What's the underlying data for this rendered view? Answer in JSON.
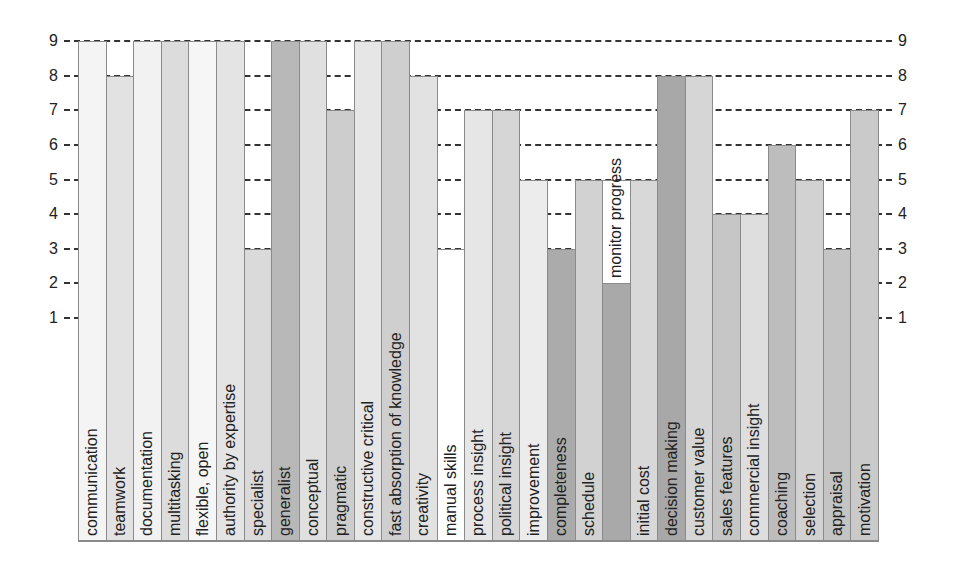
{
  "chart_data": {
    "type": "bar",
    "title": "",
    "xlabel": "",
    "ylabel": "",
    "ylim": [
      0,
      9
    ],
    "yticks": [
      1,
      2,
      3,
      4,
      5,
      6,
      7,
      8,
      9
    ],
    "y_axis_both_sides": true,
    "grid": "horizontal dashed",
    "legend": "none",
    "labels_inside_bars_rotated": true,
    "categories": [
      "communication",
      "teamwork",
      "documentation",
      "multitasking",
      "flexible, open",
      "authority by expertise",
      "specialist",
      "generalist",
      "conceptual",
      "pragmatic",
      "constructive critical",
      "fast absorption of knowledge",
      "creativity",
      "manual skills",
      "process insight",
      "political insight",
      "improvement",
      "completeness",
      "schedule",
      "monitor progress",
      "initial cost",
      "decision making",
      "customer value",
      "sales features",
      "commercial insight",
      "coaching",
      "selection",
      "appraisal",
      "motivation"
    ],
    "values": [
      9,
      8,
      9,
      9,
      9,
      9,
      3,
      9,
      9,
      7,
      9,
      9,
      8,
      3,
      7,
      7,
      5,
      3,
      5,
      2,
      5,
      8,
      8,
      4,
      4,
      6,
      5,
      3,
      7
    ],
    "colors": [
      "#f4f4f4",
      "#e2e2e2",
      "#f2f2f2",
      "#dcdcdc",
      "#f6f6f6",
      "#e4e4e4",
      "#dadada",
      "#b8b8b8",
      "#e0e0e0",
      "#cdcdcd",
      "#e6e6e6",
      "#cfcfcf",
      "#e2e2e2",
      "#ffffff",
      "#e6e6e6",
      "#d6d6d6",
      "#ececec",
      "#ababab",
      "#d2d2d2",
      "#a9a9a9",
      "#d8d8d8",
      "#a8a8a8",
      "#d6d6d6",
      "#c6c6c6",
      "#dedede",
      "#bdbdbd",
      "#d2d2d2",
      "#c4c4c4",
      "#cacaca"
    ]
  },
  "axis": {
    "left_ticks": [
      "1",
      "2",
      "3",
      "4",
      "5",
      "6",
      "7",
      "8",
      "9"
    ],
    "right_ticks": [
      "1",
      "2",
      "3",
      "4",
      "5",
      "6",
      "7",
      "8",
      "9"
    ]
  }
}
